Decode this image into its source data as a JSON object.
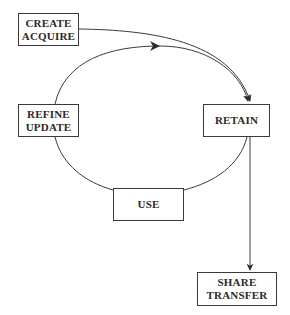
{
  "diagram": {
    "type": "lifecycle-flow",
    "stroke_color": "#3a3a3a",
    "text_color": "#2a2a2a",
    "nodes": {
      "create": {
        "line1": "CREATE",
        "line2": "ACQUIRE"
      },
      "refine": {
        "line1": "REFINE",
        "line2": "UPDATE"
      },
      "retain": {
        "line1": "RETAIN"
      },
      "use": {
        "line1": "USE"
      },
      "share": {
        "line1": "SHARE",
        "line2": "TRANSFER"
      }
    },
    "edges": [
      {
        "from": "CREATE ACQUIRE",
        "to": "RETAIN",
        "arrow": true
      },
      {
        "from": "REFINE UPDATE",
        "to": "RETAIN",
        "arrow": true,
        "note": "loop arc with mid-arrow"
      },
      {
        "from": "RETAIN",
        "to": "USE",
        "arrow": false
      },
      {
        "from": "USE",
        "to": "REFINE UPDATE",
        "arrow": false
      },
      {
        "from": "RETAIN",
        "to": "SHARE TRANSFER",
        "arrow": true
      }
    ]
  }
}
